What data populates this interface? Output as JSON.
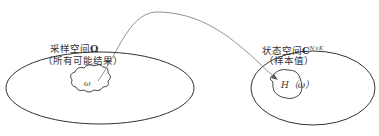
{
  "diagram": {
    "left_set": {
      "title": "采样空间",
      "symbol": "Ω",
      "subtitle": "（所有可能结果）",
      "element": "ω"
    },
    "right_set": {
      "title": "状态空间",
      "symbol": "C",
      "superscript": "N×K",
      "subtitle": "（样本值）",
      "element": "H（ω）"
    },
    "mapping": "arrow from ω to H(ω)",
    "colors": {
      "stroke": "#333333",
      "arrow": "#777777",
      "background": "#ffffff"
    }
  }
}
